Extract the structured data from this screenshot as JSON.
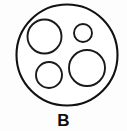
{
  "figure": {
    "panel_label": "B",
    "canvas": {
      "width": 127,
      "height": 131
    },
    "background_color": "#fdfdfd",
    "line_color": "#111111",
    "fill_color": "#ffffff"
  },
  "chart_data": {
    "type": "scatter",
    "title": "B",
    "subtitle": "",
    "xlabel": "",
    "ylabel": "",
    "legend": [],
    "grid": false,
    "xlim": [
      0,
      127
    ],
    "ylim": [
      0,
      131
    ],
    "shapes": [
      {
        "name": "outer-boundary-circle",
        "role": "container",
        "cx": 67,
        "cy": 55,
        "r": 50.5,
        "stroke": "#111111",
        "stroke_width": 2.1,
        "fill": "#ffffff"
      },
      {
        "name": "inclusion-top-left",
        "role": "inclusion",
        "cx": 44.5,
        "cy": 36.5,
        "r": 17,
        "stroke": "#1a1a1a",
        "stroke_width": 1.9,
        "fill": "#ffffff"
      },
      {
        "name": "inclusion-top-right",
        "role": "inclusion",
        "cx": 83,
        "cy": 33,
        "r": 9,
        "stroke": "#1a1a1a",
        "stroke_width": 1.9,
        "fill": "#ffffff"
      },
      {
        "name": "inclusion-bottom-right",
        "role": "inclusion",
        "cx": 87,
        "cy": 68,
        "r": 18,
        "stroke": "#1a1a1a",
        "stroke_width": 1.9,
        "fill": "#ffffff"
      },
      {
        "name": "inclusion-bottom-left",
        "role": "inclusion",
        "cx": 49,
        "cy": 75,
        "r": 13,
        "stroke": "#1a1a1a",
        "stroke_width": 1.9,
        "fill": "#ffffff"
      }
    ],
    "counts": {
      "outer_circles": 1,
      "inner_circles": 4
    }
  }
}
